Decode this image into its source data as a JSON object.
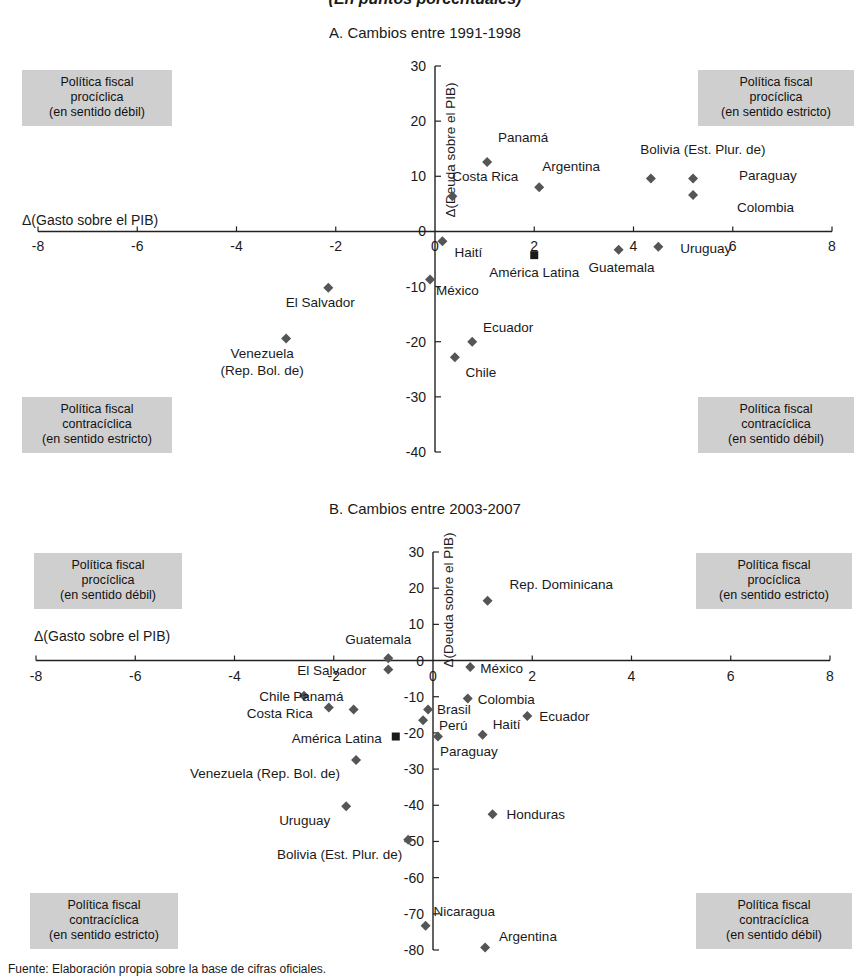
{
  "figure": {
    "supertitle": "(En puntos porcentuales)",
    "source_note": "Fuente: Elaboración propia sobre la base de cifras oficiales."
  },
  "quadrant_labels": {
    "procyclical_weak": [
      "Política fiscal",
      "procíclica",
      "(en sentido débil)"
    ],
    "procyclical_strict": [
      "Política fiscal",
      "procíclica",
      "(en sentido estricto)"
    ],
    "countercyclical_strict": [
      "Política fiscal",
      "contracíclica",
      "(en sentido estricto)"
    ],
    "countercyclical_weak": [
      "Política fiscal",
      "contracíclica",
      "(en sentido débil)"
    ]
  },
  "chart_data": [
    {
      "id": "panel-a",
      "type": "scatter",
      "title": "A. Cambios entre 1991-1998",
      "xlabel": "Δ(Gasto sobre el PIB)",
      "ylabel": "Δ(Deuda sobre el PIB)",
      "xlim": [
        -8,
        8
      ],
      "ylim": [
        -40,
        30
      ],
      "xticks": [
        -8,
        -6,
        -4,
        -2,
        0,
        2,
        4,
        6,
        8
      ],
      "xticklabels": [
        "-8",
        "-6",
        "-4",
        "-2",
        "0",
        "2",
        "4",
        "6",
        "8"
      ],
      "yticks": [
        -40,
        -30,
        -20,
        -10,
        0,
        10,
        20,
        30
      ],
      "yticklabels": [
        "-40",
        "-30",
        "-20",
        "-10",
        "0",
        "10",
        "20",
        "30"
      ],
      "grid": false,
      "legend": "none",
      "points": [
        {
          "name": "Panamá",
          "x": 1.05,
          "y": 12.6,
          "marker": "diamond",
          "label_dx": 36,
          "label_dy": -20,
          "label_anchor": "middle"
        },
        {
          "name": "Costa Rica",
          "x": 0.35,
          "y": 6.4,
          "marker": "diamond",
          "label_dx": 33,
          "label_dy": -15,
          "label_anchor": "middle"
        },
        {
          "name": "Argentina",
          "x": 2.1,
          "y": 8.0,
          "marker": "diamond",
          "label_dx": 32,
          "label_dy": -16,
          "label_anchor": "middle"
        },
        {
          "name": "Bolivia (Est. Plur. de)",
          "x": 4.35,
          "y": 9.6,
          "marker": "diamond",
          "label_dx": 52,
          "label_dy": -24,
          "label_anchor": "middle"
        },
        {
          "name": "Paraguay",
          "x": 5.2,
          "y": 9.6,
          "marker": "diamond",
          "label_dx": 46,
          "label_dy": 2,
          "label_anchor": "start"
        },
        {
          "name": "Colombia",
          "x": 5.2,
          "y": 6.6,
          "marker": "diamond",
          "label_dx": 44,
          "label_dy": 17,
          "label_anchor": "start"
        },
        {
          "name": "Haití",
          "x": 0.15,
          "y": -1.8,
          "marker": "diamond",
          "label_dx": 12,
          "label_dy": 16,
          "label_anchor": "start"
        },
        {
          "name": "México",
          "x": -0.1,
          "y": -8.7,
          "marker": "diamond",
          "label_dx": 6,
          "label_dy": 16,
          "label_anchor": "start"
        },
        {
          "name": "América Latina",
          "x": 2.0,
          "y": -4.3,
          "marker": "square",
          "label_dx": 0,
          "label_dy": 22,
          "label_anchor": "middle"
        },
        {
          "name": "Uruguay",
          "x": 4.5,
          "y": -2.8,
          "marker": "diamond",
          "label_dx": 22,
          "label_dy": 6,
          "label_anchor": "start"
        },
        {
          "name": "Guatemala",
          "x": 3.7,
          "y": -3.3,
          "marker": "diamond",
          "label_dx": 3,
          "label_dy": 22,
          "label_anchor": "middle"
        },
        {
          "name": "El Salvador",
          "x": -2.15,
          "y": -10.2,
          "marker": "diamond",
          "label_dx": -8,
          "label_dy": 19,
          "label_anchor": "middle"
        },
        {
          "name": "Venezuela (Rep. Bol. de)",
          "x": -3.0,
          "y": -19.4,
          "marker": "diamond",
          "label_dx": -24,
          "label_dy": 20,
          "label_anchor": "middle",
          "multiline": [
            "Venezuela",
            "(Rep. Bol. de)"
          ]
        },
        {
          "name": "Ecuador",
          "x": 0.75,
          "y": -20.0,
          "marker": "diamond",
          "label_dx": 36,
          "label_dy": -10,
          "label_anchor": "middle"
        },
        {
          "name": "Chile",
          "x": 0.4,
          "y": -22.8,
          "marker": "diamond",
          "label_dx": 26,
          "label_dy": 20,
          "label_anchor": "middle"
        }
      ]
    },
    {
      "id": "panel-b",
      "type": "scatter",
      "title": "B. Cambios entre 2003-2007",
      "xlabel": "Δ(Gasto sobre el PIB)",
      "ylabel": "Δ(Deuda sobre el PIB)",
      "xlim": [
        -8,
        8
      ],
      "ylim": [
        -80,
        30
      ],
      "xticks": [
        -8,
        -6,
        -4,
        -2,
        0,
        2,
        4,
        6,
        8
      ],
      "xticklabels": [
        "-8",
        "-6",
        "-4",
        "-2",
        "0",
        "2",
        "4",
        "6",
        "8"
      ],
      "yticks": [
        -80,
        -70,
        -60,
        -50,
        -40,
        -30,
        -20,
        -10,
        0,
        10,
        20,
        30
      ],
      "yticklabels": [
        "-80",
        "-70",
        "-60",
        "-50",
        "-40",
        "-30",
        "-20",
        "-10",
        "0",
        "10",
        "20",
        "30"
      ],
      "grid": false,
      "legend": "none",
      "points": [
        {
          "name": "Rep. Dominicana",
          "x": 1.1,
          "y": 16.5,
          "marker": "diamond",
          "label_dx": 22,
          "label_dy": -12,
          "label_anchor": "start"
        },
        {
          "name": "Guatemala",
          "x": -0.9,
          "y": 0.6,
          "marker": "diamond",
          "label_dx": -10,
          "label_dy": -14,
          "label_anchor": "middle"
        },
        {
          "name": "El Salvador",
          "x": -0.9,
          "y": -2.5,
          "marker": "diamond",
          "label_dx": -22,
          "label_dy": 5,
          "label_anchor": "end"
        },
        {
          "name": "México",
          "x": 0.75,
          "y": -1.8,
          "marker": "diamond",
          "label_dx": 10,
          "label_dy": 6,
          "label_anchor": "start"
        },
        {
          "name": "Chile",
          "x": -2.6,
          "y": -9.7,
          "marker": "diamond",
          "label_dx": -14,
          "label_dy": 5,
          "label_anchor": "end"
        },
        {
          "name": "Panamá",
          "x": -1.6,
          "y": -13.5,
          "marker": "diamond",
          "label_dx": -10,
          "label_dy": -8,
          "label_anchor": "end"
        },
        {
          "name": "Costa Rica",
          "x": -2.1,
          "y": -13.0,
          "marker": "diamond",
          "label_dx": -16,
          "label_dy": 10,
          "label_anchor": "end"
        },
        {
          "name": "Colombia",
          "x": 0.7,
          "y": -10.5,
          "marker": "diamond",
          "label_dx": 10,
          "label_dy": 5,
          "label_anchor": "start"
        },
        {
          "name": "Brasil",
          "x": -0.1,
          "y": -13.5,
          "marker": "diamond",
          "label_dx": 9,
          "label_dy": 5,
          "label_anchor": "start"
        },
        {
          "name": "Perú",
          "x": -0.2,
          "y": -16.5,
          "marker": "diamond",
          "label_dx": 16,
          "label_dy": 10,
          "label_anchor": "start"
        },
        {
          "name": "Ecuador",
          "x": 1.9,
          "y": -15.3,
          "marker": "diamond",
          "label_dx": 12,
          "label_dy": 5,
          "label_anchor": "start"
        },
        {
          "name": "Haití",
          "x": 1.0,
          "y": -20.5,
          "marker": "diamond",
          "label_dx": 10,
          "label_dy": -6,
          "label_anchor": "start"
        },
        {
          "name": "América Latina",
          "x": -0.75,
          "y": -21.0,
          "marker": "square",
          "label_dx": -14,
          "label_dy": 6,
          "label_anchor": "end"
        },
        {
          "name": "Paraguay",
          "x": 0.1,
          "y": -21.0,
          "marker": "diamond",
          "label_dx": 2,
          "label_dy": 19,
          "label_anchor": "start"
        },
        {
          "name": "Venezuela (Rep. Bol. de)",
          "x": -1.55,
          "y": -27.5,
          "marker": "diamond",
          "label_dx": -16,
          "label_dy": 18,
          "label_anchor": "end"
        },
        {
          "name": "Uruguay",
          "x": -1.75,
          "y": -40.3,
          "marker": "diamond",
          "label_dx": -16,
          "label_dy": 19,
          "label_anchor": "end"
        },
        {
          "name": "Honduras",
          "x": 1.2,
          "y": -42.5,
          "marker": "diamond",
          "label_dx": 14,
          "label_dy": 5,
          "label_anchor": "start"
        },
        {
          "name": "Bolivia (Est. Plur. de)",
          "x": -0.5,
          "y": -49.5,
          "marker": "diamond",
          "label_dx": -6,
          "label_dy": 19,
          "label_anchor": "end"
        },
        {
          "name": "Nicaragua",
          "x": -0.15,
          "y": -73.3,
          "marker": "diamond",
          "label_dx": 8,
          "label_dy": -10,
          "label_anchor": "start"
        },
        {
          "name": "Argentina",
          "x": 1.05,
          "y": -79.3,
          "marker": "diamond",
          "label_dx": 14,
          "label_dy": -6,
          "label_anchor": "start"
        }
      ]
    }
  ]
}
